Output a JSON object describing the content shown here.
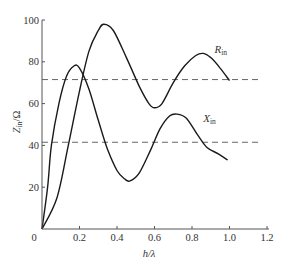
{
  "chart_data": {
    "type": "line",
    "title": "",
    "xlabel": "h/λ",
    "ylabel": "Z_in/Ω",
    "xlim": [
      0,
      1.2
    ],
    "ylim": [
      0,
      100
    ],
    "xticks": [
      0,
      0.2,
      0.4,
      0.6,
      0.8,
      1.0,
      1.2
    ],
    "xtick_labels": [
      "0",
      "0.2",
      "0.4",
      "0.6",
      "0.8",
      "1.0",
      "1.2"
    ],
    "yticks": [
      0,
      20,
      40,
      60,
      80,
      100
    ],
    "ytick_labels": [
      "0",
      "20",
      "40",
      "60",
      "80",
      "100"
    ],
    "grid": false,
    "legend": "inline labels",
    "series": [
      {
        "name": "R_in",
        "label_main": "R",
        "label_sub": "in",
        "style": "solid",
        "x": [
          0,
          0.08,
          0.14,
          0.2,
          0.25,
          0.3,
          0.33,
          0.38,
          0.45,
          0.52,
          0.57,
          0.6,
          0.64,
          0.7,
          0.76,
          0.82,
          0.86,
          0.9,
          0.95,
          1.0
        ],
        "values": [
          0,
          15,
          40,
          66,
          85,
          95,
          98,
          95,
          82,
          68,
          60,
          58,
          60,
          70,
          78,
          83,
          84,
          82,
          77,
          71
        ]
      },
      {
        "name": "X_in",
        "label_main": "X",
        "label_sub": "in",
        "style": "solid",
        "x": [
          0,
          0.03,
          0.05,
          0.09,
          0.13,
          0.17,
          0.2,
          0.25,
          0.3,
          0.35,
          0.4,
          0.44,
          0.47,
          0.52,
          0.58,
          0.63,
          0.68,
          0.72,
          0.77,
          0.83,
          0.88,
          0.94,
          0.99
        ],
        "values": [
          0,
          20,
          40,
          60,
          73,
          78,
          77,
          67,
          52,
          38,
          28,
          24,
          23,
          27,
          38,
          48,
          54,
          55,
          53,
          45,
          39,
          36,
          33
        ]
      }
    ],
    "reference_lines": [
      {
        "name": "R_in asymptote",
        "style": "dashed",
        "y": 71.5,
        "x_range": [
          0,
          1.17
        ]
      },
      {
        "name": "X_in asymptote",
        "style": "dashed",
        "y": 41.5,
        "x_range": [
          0,
          1.17
        ]
      }
    ],
    "annotations": [
      {
        "text": "R_in",
        "x": 0.92,
        "y": 84
      },
      {
        "text": "X_in",
        "x": 0.86,
        "y": 51
      }
    ]
  }
}
